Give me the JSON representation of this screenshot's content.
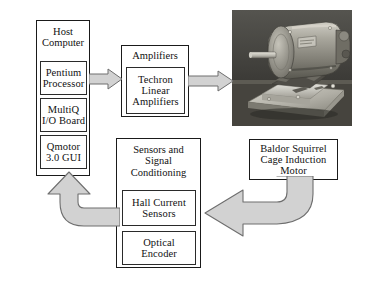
{
  "diagram": {
    "colors": {
      "box_border": "#1a1a1a",
      "arrow_fill": "#d2d2d2",
      "arrow_stroke": "#6e6e6e",
      "background": "#ffffff",
      "text": "#111111"
    },
    "host_computer": {
      "title": "Host\nComputer",
      "components": [
        {
          "label": "Pentium\nProcessor",
          "name": "pentium-processor"
        },
        {
          "label": "MultiQ\nI/O Board",
          "name": "multiq-io-board"
        },
        {
          "label": "Qmotor\n3.0 GUI",
          "name": "qmotor-gui"
        }
      ]
    },
    "amplifiers": {
      "title": "Amplifiers",
      "components": [
        {
          "label": "Techron\nLinear\nAmplifiers",
          "name": "techron-linear-amplifiers"
        }
      ]
    },
    "sensors": {
      "title": "Sensors and\nSignal\nConditioning",
      "components": [
        {
          "label": "Hall Current\nSensors",
          "name": "hall-current-sensors"
        },
        {
          "label": "Optical\nEncoder",
          "name": "optical-encoder"
        }
      ]
    },
    "motor": {
      "photo_caption": "Baldor Squirrel\nCage Induction\nMotor",
      "photo_alt": "Photograph of a Baldor squirrel cage induction motor mounted on a base plate"
    },
    "arrows": [
      {
        "name": "arrow-host-to-amplifiers",
        "from": "Host Computer",
        "to": "Amplifiers",
        "direction": "right"
      },
      {
        "name": "arrow-amplifiers-to-motor",
        "from": "Amplifiers",
        "to": "Motor",
        "direction": "right"
      },
      {
        "name": "arrow-motor-to-sensors",
        "from": "Baldor Squirrel Cage Induction Motor",
        "to": "Sensors and Signal Conditioning",
        "direction": "curved-left"
      },
      {
        "name": "arrow-sensors-to-host",
        "from": "Sensors and Signal Conditioning",
        "to": "Host Computer",
        "direction": "curved-up"
      }
    ]
  }
}
